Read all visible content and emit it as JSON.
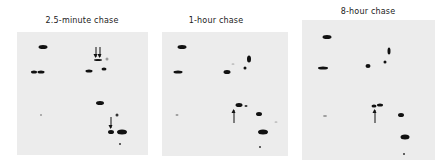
{
  "figure": {
    "panels": [
      {
        "id": "panel-2.5min",
        "caption": "2.5-minute chase",
        "caption_pos": [
          82,
          22
        ],
        "box": [
          17,
          32,
          131,
          123
        ],
        "spots": [
          {
            "x": 43,
            "y": 47,
            "w": 9,
            "h": 4,
            "tone": "dark"
          },
          {
            "x": 34,
            "y": 72,
            "w": 6,
            "h": 3,
            "tone": "dark"
          },
          {
            "x": 41,
            "y": 72,
            "w": 7,
            "h": 3,
            "tone": "dark"
          },
          {
            "x": 89,
            "y": 71,
            "w": 7,
            "h": 3,
            "tone": "dark"
          },
          {
            "x": 98,
            "y": 60,
            "w": 8,
            "h": 2,
            "tone": "dark"
          },
          {
            "x": 104,
            "y": 69,
            "w": 5,
            "h": 3,
            "tone": "dark"
          },
          {
            "x": 107,
            "y": 59,
            "w": 3,
            "h": 3,
            "tone": "faint"
          },
          {
            "x": 100,
            "y": 103,
            "w": 8,
            "h": 4,
            "tone": "dark"
          },
          {
            "x": 117,
            "y": 115,
            "w": 3,
            "h": 3,
            "tone": "med"
          },
          {
            "x": 111,
            "y": 132,
            "w": 6,
            "h": 4,
            "tone": "dark"
          },
          {
            "x": 122,
            "y": 132,
            "w": 10,
            "h": 5,
            "tone": "dark"
          },
          {
            "x": 120,
            "y": 144,
            "w": 2,
            "h": 2,
            "tone": "med"
          },
          {
            "x": 41,
            "y": 115,
            "w": 2,
            "h": 2,
            "tone": "faint"
          }
        ],
        "arrows": [
          {
            "x": 96,
            "y": 47,
            "len": 10,
            "dir": "down"
          },
          {
            "x": 100,
            "y": 47,
            "len": 10,
            "dir": "down"
          },
          {
            "x": 111,
            "y": 117,
            "len": 11,
            "dir": "down"
          }
        ]
      },
      {
        "id": "panel-1h",
        "caption": "1-hour chase",
        "caption_pos": [
          216,
          22
        ],
        "box": [
          162,
          32,
          126,
          124
        ],
        "spots": [
          {
            "x": 182,
            "y": 47,
            "w": 9,
            "h": 4,
            "tone": "dark"
          },
          {
            "x": 178,
            "y": 72,
            "w": 9,
            "h": 3,
            "tone": "dark"
          },
          {
            "x": 227,
            "y": 72,
            "w": 7,
            "h": 4,
            "tone": "dark"
          },
          {
            "x": 249,
            "y": 59,
            "w": 4,
            "h": 7,
            "tone": "dark"
          },
          {
            "x": 245,
            "y": 68,
            "w": 3,
            "h": 3,
            "tone": "dark"
          },
          {
            "x": 233,
            "y": 64,
            "w": 3,
            "h": 1,
            "tone": "faint"
          },
          {
            "x": 239,
            "y": 105,
            "w": 7,
            "h": 4,
            "tone": "dark"
          },
          {
            "x": 246,
            "y": 106,
            "w": 3,
            "h": 2,
            "tone": "med"
          },
          {
            "x": 259,
            "y": 114,
            "w": 6,
            "h": 4,
            "tone": "dark"
          },
          {
            "x": 263,
            "y": 132,
            "w": 10,
            "h": 5,
            "tone": "dark"
          },
          {
            "x": 260,
            "y": 147,
            "w": 2,
            "h": 2,
            "tone": "med"
          },
          {
            "x": 177,
            "y": 115,
            "w": 3,
            "h": 2,
            "tone": "faint"
          },
          {
            "x": 276,
            "y": 122,
            "w": 3,
            "h": 1,
            "tone": "faint"
          }
        ],
        "arrows": [
          {
            "x": 234,
            "y": 110,
            "len": 13,
            "dir": "up"
          }
        ]
      },
      {
        "id": "panel-8h",
        "caption": "8-hour chase",
        "caption_pos": [
          368,
          13
        ],
        "box": [
          302,
          20,
          133,
          140
        ],
        "spots": [
          {
            "x": 327,
            "y": 37,
            "w": 9,
            "h": 4,
            "tone": "dark"
          },
          {
            "x": 323,
            "y": 68,
            "w": 10,
            "h": 3,
            "tone": "dark"
          },
          {
            "x": 368,
            "y": 66,
            "w": 5,
            "h": 4,
            "tone": "dark"
          },
          {
            "x": 389,
            "y": 51,
            "w": 3,
            "h": 7,
            "tone": "dark"
          },
          {
            "x": 385,
            "y": 62,
            "w": 3,
            "h": 3,
            "tone": "dark"
          },
          {
            "x": 374,
            "y": 106,
            "w": 5,
            "h": 3,
            "tone": "dark"
          },
          {
            "x": 380,
            "y": 105,
            "w": 6,
            "h": 3,
            "tone": "dark"
          },
          {
            "x": 401,
            "y": 115,
            "w": 6,
            "h": 4,
            "tone": "dark"
          },
          {
            "x": 405,
            "y": 137,
            "w": 9,
            "h": 5,
            "tone": "dark"
          },
          {
            "x": 404,
            "y": 154,
            "w": 2,
            "h": 2,
            "tone": "med"
          },
          {
            "x": 325,
            "y": 116,
            "w": 4,
            "h": 2,
            "tone": "faint"
          }
        ],
        "arrows": [
          {
            "x": 375,
            "y": 110,
            "len": 13,
            "dir": "up"
          }
        ]
      }
    ]
  }
}
